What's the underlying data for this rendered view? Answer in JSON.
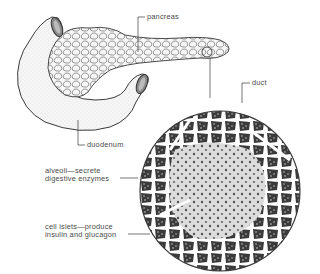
{
  "diagram": {
    "labels": {
      "pancreas": "pancreas",
      "duct": "duct",
      "duodenum": "duodenum",
      "alveoli_line1": "alveoli—secrete",
      "alveoli_line2": "digestive enzymes",
      "islets_line1": "cell islets—produce",
      "islets_line2": "insulin and glucagon"
    },
    "colors": {
      "line": "#3a3a3a",
      "text": "#4a4a4a",
      "tissue_dark": "#2e2e2e",
      "tissue_light": "#d8d8d8",
      "organ_fill": "#f4f4f4"
    }
  }
}
